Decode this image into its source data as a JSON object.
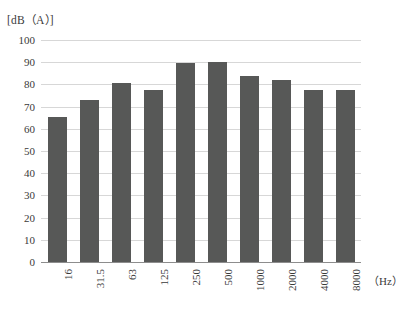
{
  "chart_data": {
    "type": "bar",
    "title": "",
    "ylabel": "[dB（A）]",
    "xlabel": "（Hz）",
    "categories": [
      "16",
      "31.5",
      "63",
      "125",
      "250",
      "500",
      "1000",
      "2000",
      "4000",
      "8000"
    ],
    "values": [
      65.5,
      73,
      80.5,
      77.5,
      89.5,
      90,
      84,
      82,
      77.5,
      77.5
    ],
    "ylim": [
      0,
      100
    ],
    "ytick_labels": [
      "100",
      "90",
      "80",
      "70",
      "60",
      "50",
      "40",
      "30",
      "20",
      "10",
      "0"
    ],
    "ytick_values": [
      100,
      90,
      80,
      70,
      60,
      50,
      40,
      30,
      20,
      10,
      0
    ],
    "ytick_step": 10,
    "grid": true,
    "legend": false,
    "legend_position": "none",
    "bar_color": "#575857",
    "gridline_color": "#d7d7d7",
    "axis_color": "#8d8d8d",
    "background_color": "#ffffff",
    "xtick_rotation": 90
  }
}
